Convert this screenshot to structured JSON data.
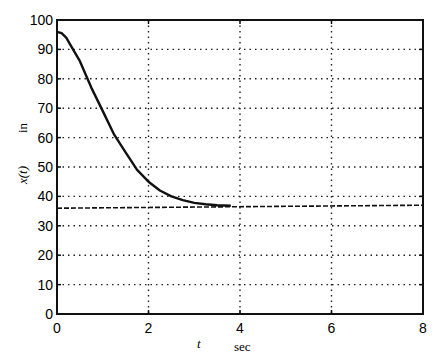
{
  "chart_data": {
    "type": "line",
    "title": "",
    "xlabel": "t",
    "xlabel_unit": "sec",
    "ylabel": "x(t)",
    "ylabel_unit": "in",
    "xlim": [
      0,
      8
    ],
    "ylim": [
      0,
      100
    ],
    "xticks": [
      0,
      2,
      4,
      6,
      8
    ],
    "yticks": [
      0,
      10,
      20,
      30,
      40,
      50,
      60,
      70,
      80,
      90,
      100
    ],
    "grid": true,
    "legend": null,
    "series": [
      {
        "name": "x(t)",
        "style": "solid",
        "x": [
          0,
          0.1,
          0.2,
          0.35,
          0.5,
          0.75,
          1.0,
          1.25,
          1.5,
          1.75,
          2.0,
          2.25,
          2.5,
          2.75,
          3.0,
          3.25,
          3.5,
          3.8
        ],
        "y": [
          96,
          95.5,
          94,
          90,
          86,
          77,
          69,
          61,
          55,
          49,
          45,
          42,
          40,
          38.7,
          37.8,
          37.3,
          37,
          36.8
        ]
      },
      {
        "name": "steady-state",
        "style": "dashed",
        "x": [
          0,
          8
        ],
        "y": [
          36,
          37
        ]
      }
    ]
  }
}
